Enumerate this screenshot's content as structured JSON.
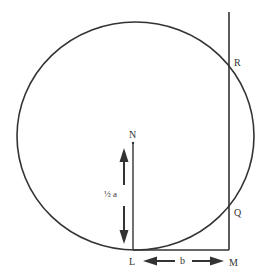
{
  "diagram": {
    "colors": {
      "stroke": "#333333",
      "background": "#ffffff"
    },
    "labels": {
      "N": "N",
      "L": "L",
      "M": "M",
      "R": "R",
      "Q": "Q",
      "half_a": "½ a",
      "b": "b"
    }
  }
}
